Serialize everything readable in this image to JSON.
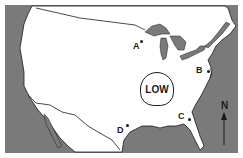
{
  "map": {
    "title": "",
    "region": "Continental United States",
    "colors": {
      "land": "#ffffff",
      "water": "#7a7a7a",
      "border": "#1a1a1a"
    },
    "pressure_system": {
      "label": "LOW"
    },
    "locations": [
      {
        "id": "A",
        "label": "A",
        "x": 142,
        "y": 40
      },
      {
        "id": "B",
        "label": "B",
        "x": 205,
        "y": 70
      },
      {
        "id": "C",
        "label": "C",
        "x": 188,
        "y": 118
      },
      {
        "id": "D",
        "label": "D",
        "x": 125,
        "y": 126
      }
    ],
    "compass": {
      "label": "N",
      "direction": "north"
    }
  }
}
